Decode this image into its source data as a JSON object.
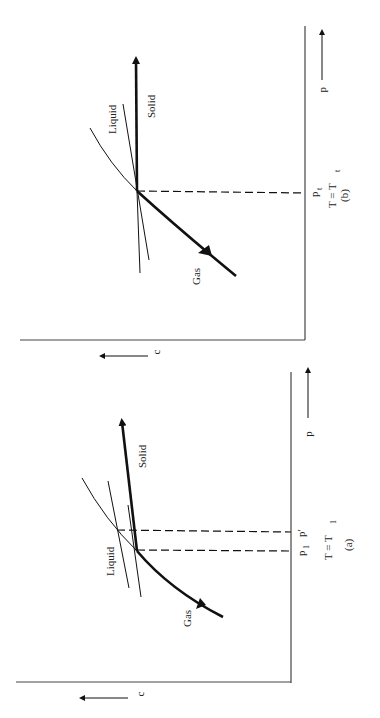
{
  "figure": {
    "orientation": "rotated 90 degrees counter-clockwise",
    "panel_b": {
      "caption": "(b)",
      "condition": "T = T",
      "condition_sub": "t",
      "x_axis_label": "p",
      "y_axis_label": "c",
      "tick_label": "p",
      "tick_label_sub": "t",
      "curve_labels": {
        "liquid": "Liquid",
        "solid": "Solid",
        "gas": "Gas"
      }
    },
    "panel_a": {
      "caption": "(a)",
      "condition": "T = T",
      "condition_sub": "1",
      "x_axis_label": "p",
      "y_axis_label": "c",
      "tick_labels": [
        {
          "label": "p",
          "sub": "1"
        },
        {
          "label": "p′",
          "sub": ""
        }
      ],
      "curve_labels": {
        "liquid": "Liquid",
        "solid": "Solid",
        "gas": "Gas"
      }
    }
  }
}
